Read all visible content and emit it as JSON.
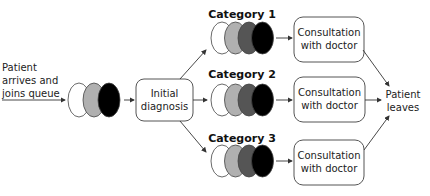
{
  "diagram": {
    "type": "flowchart",
    "title": "",
    "start_label": [
      "Patient",
      "arrives and",
      "joins queue"
    ],
    "entry_queue": {
      "shades": [
        "#ffffff",
        "#b0b0b0",
        "#000000"
      ]
    },
    "initial_box": [
      "Initial",
      "diagnosis"
    ],
    "categories": [
      {
        "name": "Category 1",
        "queue_shades": [
          "#ffffff",
          "#b0b0b0",
          "#555555",
          "#000000"
        ],
        "consult": [
          "Consultation",
          "with doctor"
        ]
      },
      {
        "name": "Category 2",
        "queue_shades": [
          "#ffffff",
          "#b0b0b0",
          "#555555",
          "#000000"
        ],
        "consult": [
          "Consultation",
          "with doctor"
        ]
      },
      {
        "name": "Category 3",
        "queue_shades": [
          "#ffffff",
          "#b0b0b0",
          "#555555",
          "#000000"
        ],
        "consult": [
          "Consultation",
          "with doctor"
        ]
      }
    ],
    "end_label": [
      "Patient",
      "leaves"
    ]
  }
}
